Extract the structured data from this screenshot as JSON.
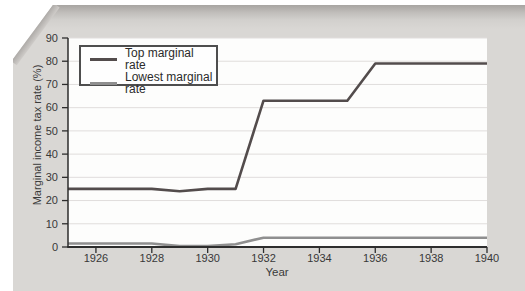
{
  "chart_data": {
    "type": "line",
    "title": "",
    "xlabel": "Year",
    "ylabel": "Marginal income tax rate (%)",
    "xlim": [
      1925,
      1940
    ],
    "ylim": [
      0,
      90
    ],
    "x_ticks": [
      1926,
      1928,
      1930,
      1932,
      1934,
      1936,
      1938,
      1940
    ],
    "y_ticks": [
      0,
      10,
      20,
      30,
      40,
      50,
      60,
      70,
      80,
      90
    ],
    "grid": "horizontal",
    "legend_position": "top-left",
    "x": [
      1925,
      1926,
      1927,
      1928,
      1929,
      1930,
      1931,
      1932,
      1933,
      1934,
      1935,
      1936,
      1937,
      1938,
      1939,
      1940
    ],
    "series": [
      {
        "name": "Top marginal rate",
        "color": "#534c4c",
        "values": [
          25,
          25,
          25,
          25,
          24,
          25,
          25,
          63,
          63,
          63,
          63,
          79,
          79,
          79,
          79,
          79
        ]
      },
      {
        "name": "Lowest marginal rate",
        "color": "#8f8f8f",
        "values": [
          1.5,
          1.5,
          1.5,
          1.5,
          0.4,
          0.4,
          1.2,
          4,
          4,
          4,
          4,
          4,
          4,
          4,
          4,
          4
        ]
      }
    ]
  }
}
